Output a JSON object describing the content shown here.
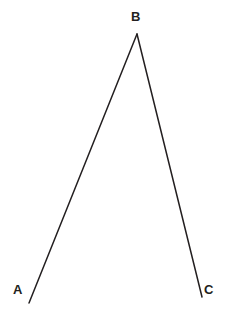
{
  "figure": {
    "type": "geometry-diagram",
    "background_color": "#ffffff",
    "stroke_color": "#231f20",
    "stroke_width": 1.5,
    "label_color": "#231f20",
    "width": 234,
    "height": 323,
    "vertices": [
      {
        "id": "A",
        "label": "A",
        "point_x": 29,
        "point_y": 303,
        "label_x": 13,
        "label_y": 283
      },
      {
        "id": "B",
        "label": "B",
        "point_x": 137,
        "point_y": 34,
        "label_x": 131,
        "label_y": 10
      },
      {
        "id": "C",
        "label": "C",
        "point_x": 202,
        "point_y": 297,
        "label_x": 204,
        "label_y": 283
      }
    ],
    "segments": [
      {
        "id": "BA",
        "from": "B",
        "to": "A",
        "x1": 137,
        "y1": 34,
        "x2": 29,
        "y2": 303
      },
      {
        "id": "BC",
        "from": "B",
        "to": "C",
        "x1": 137,
        "y1": 34,
        "x2": 202,
        "y2": 297
      }
    ]
  },
  "chart_data": {
    "type": "scatter",
    "title": "",
    "xlabel": "",
    "ylabel": "",
    "points": [
      {
        "label": "A",
        "x": 29,
        "y": 303
      },
      {
        "label": "B",
        "x": 137,
        "y": 34
      },
      {
        "label": "C",
        "x": 202,
        "y": 297
      }
    ],
    "lines": [
      {
        "name": "BA",
        "x": [
          137,
          29
        ],
        "y": [
          34,
          303
        ]
      },
      {
        "name": "BC",
        "x": [
          137,
          202
        ],
        "y": [
          34,
          297
        ]
      }
    ],
    "legend": [],
    "grid": false,
    "xlim": [
      0,
      234
    ],
    "ylim": [
      0,
      323
    ]
  }
}
